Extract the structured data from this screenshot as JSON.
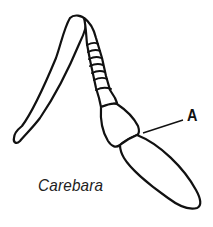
{
  "figure": {
    "parts": [
      "scape",
      "funiculus segments",
      "club segment 1",
      "club segment 2"
    ],
    "label": "A",
    "caption": "Carebara",
    "stroke_color": "#111111",
    "background": "#ffffff"
  }
}
